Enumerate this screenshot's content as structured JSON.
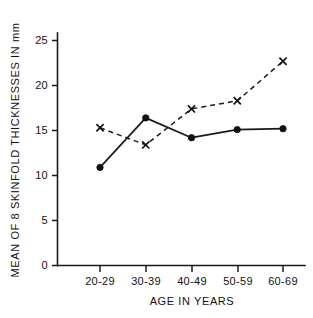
{
  "chart_data": {
    "type": "line",
    "title": "",
    "subtitle": "",
    "xlabel": "AGE IN YEARS",
    "ylabel": "MEAN OF 8 SKINFOLD THICKNESSES IN mm",
    "categories": [
      "20-29",
      "30-39",
      "40-49",
      "50-59",
      "60-69"
    ],
    "ylim": [
      0,
      26
    ],
    "ytick_labels": [
      "0",
      "5",
      "10",
      "15",
      "20",
      "25"
    ],
    "ytick_values": [
      0,
      5,
      10,
      15,
      20,
      25
    ],
    "grid": false,
    "legend": "none",
    "series": [
      {
        "name": "solid-circles",
        "marker": "filled-circle",
        "linestyle": "solid",
        "color": "#121212",
        "values": [
          10.9,
          16.4,
          14.2,
          15.1,
          15.2
        ]
      },
      {
        "name": "dashed-crosses",
        "marker": "x",
        "linestyle": "dashed",
        "color": "#121212",
        "values": [
          15.3,
          13.4,
          17.4,
          18.3,
          22.7
        ]
      }
    ]
  },
  "axes": {
    "y_axis_name": "y-axis",
    "x_axis_name": "x-axis"
  }
}
